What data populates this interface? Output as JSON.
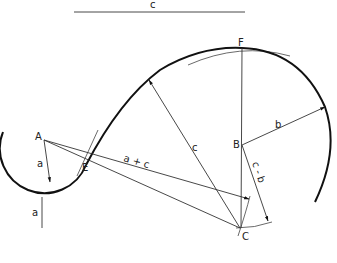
{
  "diagram": {
    "reference_segments": {
      "c": {
        "label": "c"
      },
      "a": {
        "label": "a"
      }
    },
    "points": {
      "A": {
        "label": "A"
      },
      "B": {
        "label": "B"
      },
      "C": {
        "label": "C"
      },
      "E": {
        "label": "E"
      },
      "F": {
        "label": "F"
      }
    },
    "dimensions": {
      "a": {
        "label": "a"
      },
      "b": {
        "label": "b"
      },
      "c": {
        "label": "c"
      },
      "a_plus_c": {
        "label": "a + c"
      },
      "c_minus_b": {
        "label": "c - b"
      }
    },
    "colors": {
      "line": "#333333",
      "curve": "#111111",
      "background": "#ffffff"
    }
  }
}
